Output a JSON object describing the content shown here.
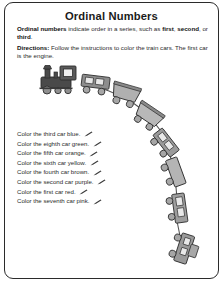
{
  "worksheet": {
    "title": "Ordinal Numbers",
    "definition": {
      "lead": "Ordinal numbers",
      "text_1": " indicate order in a series, such as ",
      "bold_1": "first",
      "text_2": ", ",
      "bold_2": "second",
      "text_3": ", or ",
      "bold_3": "third",
      "text_4": "."
    },
    "directions": {
      "lead": "Directions:",
      "text": " Follow the instructions to color the train cars. The first car is the engine."
    },
    "instructions": [
      {
        "text": "Color the third car blue.",
        "ordinal": "third",
        "color": "blue",
        "icon": "pencil-icon"
      },
      {
        "text": "Color the eighth car green.",
        "ordinal": "eighth",
        "color": "green",
        "icon": "pencil-icon"
      },
      {
        "text": "Color the fifth car orange.",
        "ordinal": "fifth",
        "color": "orange",
        "icon": "pencil-icon"
      },
      {
        "text": "Color the sixth car yellow.",
        "ordinal": "sixth",
        "color": "yellow",
        "icon": "pencil-icon"
      },
      {
        "text": "Color the fourth car brown.",
        "ordinal": "fourth",
        "color": "brown",
        "icon": "pencil-icon"
      },
      {
        "text": "Color the second car purple.",
        "ordinal": "second",
        "color": "purple",
        "icon": "pencil-icon"
      },
      {
        "text": "Color the first car red.",
        "ordinal": "first",
        "color": "red",
        "icon": "pencil-icon"
      },
      {
        "text": "Color the seventh car pink.",
        "ordinal": "seventh",
        "color": "pink",
        "icon": "pencil-icon"
      }
    ],
    "illustration": {
      "name": "train-illustration",
      "car_count": 8,
      "cars": [
        {
          "position": 1,
          "name": "locomotive-engine"
        },
        {
          "position": 2,
          "name": "passenger-car"
        },
        {
          "position": 3,
          "name": "hopper-car"
        },
        {
          "position": 4,
          "name": "hopper-car"
        },
        {
          "position": 5,
          "name": "passenger-car"
        },
        {
          "position": 6,
          "name": "flat-car"
        },
        {
          "position": 7,
          "name": "passenger-car"
        },
        {
          "position": 8,
          "name": "caboose-car"
        }
      ]
    },
    "colors": {
      "border": "#2b2b2b",
      "page_background": "#ffffff",
      "text": "#2a2a2a",
      "engine_body": "#4a4a4a",
      "car_body": "#a8a8a8",
      "car_body_light": "#c4c4c4",
      "outline": "#333333"
    }
  }
}
